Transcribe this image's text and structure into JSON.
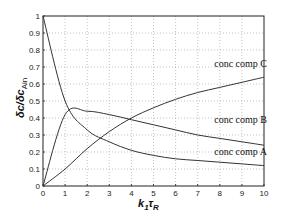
{
  "chart_data": {
    "type": "line",
    "title": "",
    "xlabel": "k1τR",
    "ylabel": "δc/δcAin",
    "xlim": [
      0,
      10
    ],
    "ylim": [
      0,
      1
    ],
    "grid": true,
    "legend": "inline labels",
    "x_ticks": [
      "0",
      "1",
      "2",
      "3",
      "4",
      "5",
      "6",
      "7",
      "8",
      "9",
      "10"
    ],
    "y_ticks": [
      "0",
      "0.1",
      "0.2",
      "0.3",
      "0.4",
      "0.5",
      "0.6",
      "0.7",
      "0.8",
      "0.9",
      "1"
    ],
    "x": [
      0,
      1,
      2,
      3,
      4,
      5,
      6,
      7,
      8,
      9,
      10
    ],
    "series": [
      {
        "name": "conc comp A",
        "values": [
          1.0,
          0.5,
          0.33,
          0.26,
          0.21,
          0.18,
          0.16,
          0.15,
          0.14,
          0.13,
          0.12
        ]
      },
      {
        "name": "conc comp B",
        "values": [
          0.0,
          0.42,
          0.44,
          0.42,
          0.39,
          0.36,
          0.33,
          0.3,
          0.28,
          0.26,
          0.24
        ]
      },
      {
        "name": "conc comp C",
        "values": [
          0.0,
          0.1,
          0.22,
          0.32,
          0.4,
          0.46,
          0.51,
          0.55,
          0.58,
          0.61,
          0.64
        ]
      }
    ],
    "annotations": [
      {
        "text": "conc comp C",
        "x": 8.2,
        "y": 0.7
      },
      {
        "text": "conc comp B",
        "x": 8.2,
        "y": 0.37
      },
      {
        "text": "conc comp A",
        "x": 8.2,
        "y": 0.18
      }
    ]
  },
  "axis": {
    "xlabel_main": "k",
    "xlabel_sub1": "1",
    "xlabel_tau": "τ",
    "xlabel_sub2": "R",
    "ylabel_main": "δc/δc",
    "ylabel_sub": "Ain"
  }
}
